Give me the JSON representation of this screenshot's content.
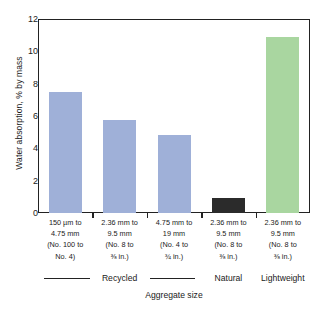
{
  "chart_data": {
    "type": "bar",
    "title": "",
    "xlabel": "Aggregate size",
    "ylabel": "Water absorption, % by mass",
    "ylim": [
      0,
      12
    ],
    "yticks": [
      0,
      2,
      4,
      6,
      8,
      10,
      12
    ],
    "grid": false,
    "legend": "none",
    "categories": [
      "150 µm to 4.75 mm (No. 100 to 3/8 in.)",
      "2.36 mm to 9.5 mm (No. 8 to 3/8 in.)",
      "4.75 mm to 19 mm (No. 4 to 3/4 in.)",
      "2.36 mm to 9.5 mm (No. 8 to 3/8 in.)",
      "2.36 mm to 9.5 mm (No. 8 to 3/8 in.)"
    ],
    "values": [
      7.5,
      5.75,
      4.85,
      0.9,
      10.9
    ],
    "bar_colors": [
      "#9fb0d8",
      "#9fb0d8",
      "#9fb0d8",
      "#2b2b2b",
      "#a9d6a0"
    ],
    "groups": [
      {
        "label": "Recycled",
        "bars": [
          0,
          1,
          2
        ]
      },
      {
        "label": "Natural",
        "bars": [
          3
        ]
      },
      {
        "label": "Lightweight",
        "bars": [
          4
        ]
      }
    ]
  },
  "axes": {
    "y_title": "Water absorption, % by mass",
    "x_title": "Aggregate size",
    "y_tick_labels": [
      "0",
      "2",
      "4",
      "6",
      "8",
      "10",
      "12"
    ]
  },
  "x_tick_labels": [
    {
      "line1": "150 µm to",
      "line2": "4.75 mm",
      "line3": "(No. 100 to",
      "line4": "No. 4)"
    },
    {
      "line1": "2.36 mm to",
      "line2": "9.5 mm",
      "line3": "(No. 8 to",
      "line4": "⅜ in.)"
    },
    {
      "line1": "4.75 mm to",
      "line2": "19 mm",
      "line3": "(No. 4 to",
      "line4": "¾ in.)"
    },
    {
      "line1": "2.36 mm to",
      "line2": "9.5 mm",
      "line3": "(No. 8 to",
      "line4": "⅜ in.)"
    },
    {
      "line1": "2.36 mm to",
      "line2": "9.5 mm",
      "line3": "(No. 8 to",
      "line4": "⅜ in.)"
    }
  ],
  "group_labels": {
    "recycled": "Recycled",
    "natural": "Natural",
    "lightweight": "Lightweight"
  },
  "colors": {
    "recycled_bar": "#9fb0d8",
    "natural_bar": "#2b2b2b",
    "lightweight_bar": "#a9d6a0",
    "axis": "#222222",
    "text": "#1a1a1a",
    "background": "#ffffff"
  }
}
